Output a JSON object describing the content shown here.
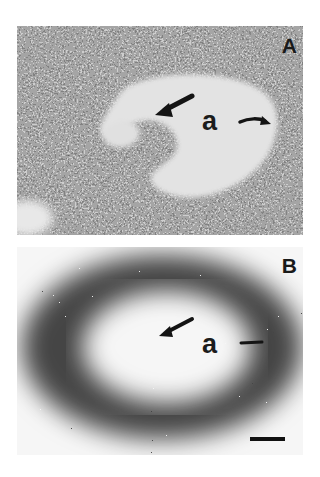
{
  "figure": {
    "panels": [
      {
        "id": "A",
        "label": "A",
        "description": "Histological section showing an oval structure with a dense cellular wall surrounding a pale central lumen; a thick arrow points to a cellular projection into the lumen and a curved arrow points to the lumen edge",
        "region_label": "a",
        "annotations": [
          "straight-arrow",
          "curved-arrow"
        ]
      },
      {
        "id": "B",
        "label": "B",
        "description": "Autoradiograph/silver-grain labeling of the corresponding section; dense dark grains in the surrounding wall with a sparsely labeled pale center",
        "region_label": "a",
        "annotations": [
          "straight-arrow",
          "short-arrow"
        ],
        "scale_bar": true
      }
    ]
  },
  "colors": {
    "background": "#ffffff",
    "tissue_dark": "#2a2a2a",
    "tissue_mid": "#6e6e6e",
    "lumen": "#e2e2e2",
    "grain": "#151515"
  }
}
